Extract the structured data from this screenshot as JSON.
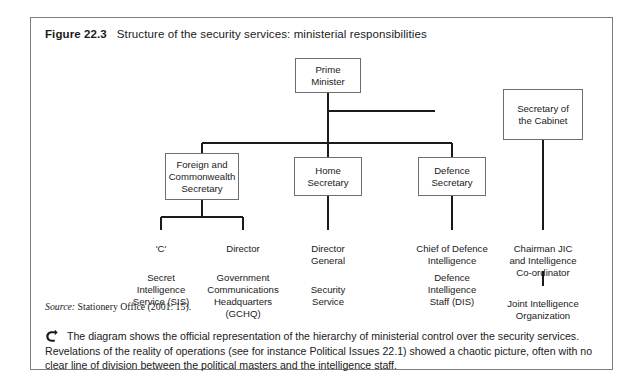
{
  "figure": {
    "label": "Figure 22.3",
    "title": "Structure of the security services: ministerial responsibilities"
  },
  "diagram": {
    "nodes": {
      "prime_minister": "Prime\nMinister",
      "secretary_cabinet": "Secretary of\nthe Cabinet",
      "foreign_commonwealth": "Foreign and\nCommonwealth\nSecretary",
      "home_secretary": "Home\nSecretary",
      "defence_secretary": "Defence\nSecretary",
      "c_head": "'C'",
      "director_gchq": "Director",
      "director_general": "Director\nGeneral",
      "chief_defence_intelligence": "Chief of Defence\nIntelligence",
      "chairman_jic": "Chairman JIC\nand Intelligence\nCo-ordinator",
      "sis": "Secret\nIntelligence\nService (SIS)",
      "gchq": "Government\nCommunications\nHeadquarters\n(GCHQ)",
      "security_service": "Security\nService",
      "dis": "Defence\nIntelligence\nStaff (DIS)",
      "jio": "Joint Intelligence\nOrganization"
    }
  },
  "source": {
    "label": "Source:",
    "text": "Stationery Office (2001: 15)."
  },
  "note": {
    "bullet_icon": "right-arrow-bullet-icon",
    "text": "The diagram shows the official representation of the hierarchy of ministerial control over the security services. Revelations of the reality of operations (see for instance Political Issues 22.1) showed a chaotic picture, often with no clear line of division between the political masters and the intelligence staff."
  },
  "colors": {
    "frame_border": "#7d7d7d",
    "box_border": "#6e6e6e",
    "connector": "#1a1a1a",
    "text": "#1a1a1a",
    "background": "#ffffff"
  }
}
